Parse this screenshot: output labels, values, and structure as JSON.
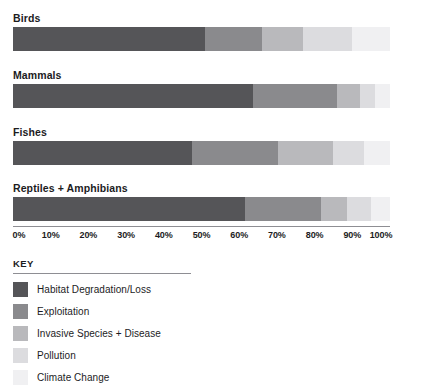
{
  "chart_data": {
    "type": "bar",
    "orientation": "horizontal",
    "stacked": true,
    "normalized": true,
    "title": "",
    "subtitle": "",
    "xlabel": "",
    "ylabel": "",
    "xlim": [
      0,
      100
    ],
    "grid": false,
    "legend_position": "bottom-left",
    "legend_title": "KEY",
    "categories": [
      "Birds",
      "Mammals",
      "Fishes",
      "Reptiles + Amphibians"
    ],
    "tick_labels": [
      "0%",
      "10%",
      "20%",
      "30%",
      "40%",
      "50%",
      "60%",
      "70%",
      "80%",
      "90%",
      "100%"
    ],
    "tick_values": [
      0,
      10,
      20,
      30,
      40,
      50,
      60,
      70,
      80,
      90,
      100
    ],
    "series": [
      {
        "name": "Habitat Degradation/Loss",
        "color": "#555558",
        "values": [
          51.0,
          63.7,
          47.5,
          61.5
        ]
      },
      {
        "name": "Exploitation",
        "color": "#8a8a8d",
        "values": [
          15.0,
          22.3,
          22.8,
          20.2
        ]
      },
      {
        "name": "Invasive Species + Disease",
        "color": "#b9b9bc",
        "values": [
          11.0,
          6.0,
          14.7,
          6.9
        ]
      },
      {
        "name": "Pollution",
        "color": "#dcdcdf",
        "values": [
          13.0,
          4.0,
          8.0,
          6.4
        ]
      },
      {
        "name": "Climate Change",
        "color": "#f0f0f2",
        "values": [
          10.0,
          4.0,
          7.0,
          5.0
        ]
      }
    ]
  },
  "legend": {
    "title": "KEY",
    "items": [
      {
        "label": "Habitat Degradation/Loss",
        "color": "#555558"
      },
      {
        "label": "Exploitation",
        "color": "#8a8a8d"
      },
      {
        "label": "Invasive Species + Disease",
        "color": "#b9b9bc"
      },
      {
        "label": "Pollution",
        "color": "#dcdcdf"
      },
      {
        "label": "Climate Change",
        "color": "#f0f0f2"
      }
    ]
  }
}
